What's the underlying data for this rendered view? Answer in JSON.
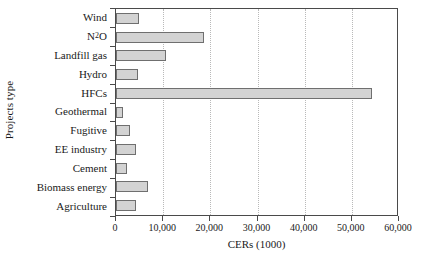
{
  "chart_data": {
    "type": "bar",
    "orientation": "horizontal",
    "title": "",
    "xlabel": "CERs (1000)",
    "ylabel": "Projects type",
    "xlim": [
      0,
      60000
    ],
    "grid": "vertical-dotted",
    "legend": "none",
    "xticks": [
      0,
      10000,
      20000,
      30000,
      40000,
      50000,
      60000
    ],
    "xtick_labels": [
      "0",
      "10,000",
      "20,000",
      "30,000",
      "40,000",
      "50,000",
      "60,000"
    ],
    "categories": [
      "Wind",
      "N₂O",
      "Landfill gas",
      "Hydro",
      "HFCs",
      "Geothermal",
      "Fugitive",
      "EE industry",
      "Cement",
      "Biomass energy",
      "Agriculture"
    ],
    "values": [
      4800,
      18600,
      10700,
      4600,
      54200,
      1400,
      3000,
      4200,
      2300,
      6700,
      4300
    ],
    "bar_fill_color": "#d3d3d3",
    "bar_border_color": "#6f6f6f",
    "axis_color": "#4a4a4a",
    "gridline_color": "#b9b9b9"
  },
  "axes": {
    "y_title": "Projects type",
    "x_title": "CERs (1000)"
  },
  "category_labels_html": [
    "Wind",
    "N<sub>2</sub>O",
    "Landfill gas",
    "Hydro",
    "HFCs",
    "Geothermal",
    "Fugitive",
    "EE industry",
    "Cement",
    "Biomass energy",
    "Agriculture"
  ]
}
